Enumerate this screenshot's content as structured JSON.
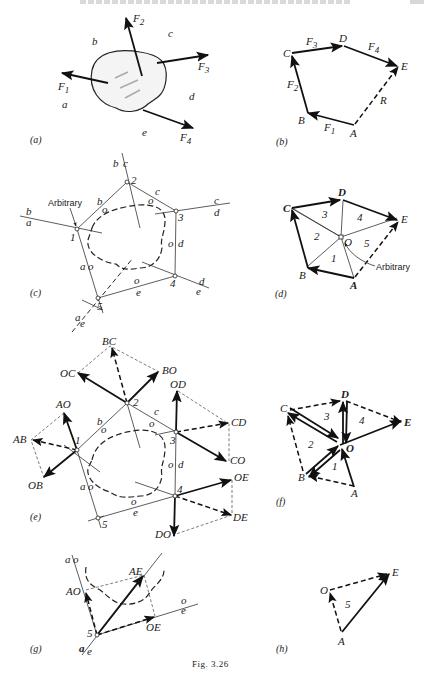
{
  "page": {
    "figure_caption": "Fig. 3.26"
  },
  "panels": {
    "a": {
      "caption": "(a)",
      "forces": [
        "F1",
        "F2",
        "F3",
        "F4"
      ],
      "force_labels": {
        "F1": "F",
        "F2": "F",
        "F3": "F",
        "F4": "F"
      },
      "force_subs": {
        "F1": "1",
        "F2": "2",
        "F3": "3",
        "F4": "4"
      },
      "spaces": [
        "a",
        "b",
        "c",
        "d",
        "e"
      ]
    },
    "b": {
      "caption": "(b)",
      "points": [
        "A",
        "B",
        "C",
        "D",
        "E"
      ],
      "vectors": [
        {
          "name": "F1",
          "from": "A",
          "to": "B",
          "style": "solid"
        },
        {
          "name": "F2",
          "from": "B",
          "to": "C",
          "style": "solid"
        },
        {
          "name": "F3",
          "from": "C",
          "to": "D",
          "style": "solid"
        },
        {
          "name": "F4",
          "from": "D",
          "to": "E",
          "style": "solid"
        },
        {
          "name": "R",
          "from": "A",
          "to": "E",
          "style": "dashed"
        }
      ],
      "resultant_label": "R"
    },
    "c": {
      "caption": "(c)",
      "nodes": [
        "1",
        "2",
        "3",
        "4",
        "5"
      ],
      "annotation": "Arbitrary",
      "line_labels": {
        "ba_top": "b",
        "ba_bot": "a",
        "bc_left": "b",
        "bc_right": "c",
        "cd_top": "c",
        "cd_bot": "d",
        "de_top": "d",
        "de_bot": "e",
        "ae_top": "a",
        "ae_bot": "e",
        "b": "b",
        "c": "c",
        "o": "o",
        "d": "d",
        "e": "e",
        "a": "a"
      }
    },
    "d": {
      "caption": "(d)",
      "points": [
        "A",
        "B",
        "C",
        "D",
        "E",
        "O"
      ],
      "triangles": [
        "1",
        "2",
        "3",
        "4",
        "5"
      ],
      "annotation": "Arbitrary"
    },
    "e": {
      "caption": "(e)",
      "nodes": [
        "1",
        "2",
        "3",
        "4",
        "5"
      ],
      "components": [
        "AO",
        "AB",
        "OB",
        "BC",
        "OC",
        "BO",
        "OD",
        "CD",
        "CO",
        "OE",
        "DE",
        "DO"
      ],
      "line_labels": {
        "b": "b",
        "c": "c",
        "o": "o",
        "d": "d",
        "a": "a",
        "e": "e"
      }
    },
    "f": {
      "caption": "(f)",
      "points": [
        "A",
        "B",
        "C",
        "D",
        "E",
        "O"
      ],
      "triangles": [
        "1",
        "2",
        "3",
        "4"
      ]
    },
    "g": {
      "caption": "(g)",
      "node": "5",
      "components": [
        "AO",
        "AE",
        "OE"
      ],
      "line_labels": {
        "ao_top": "a",
        "ao_right": "o",
        "oe_top": "o",
        "oe_bot": "e",
        "ae_left": "a",
        "ae_right": "e"
      }
    },
    "h": {
      "caption": "(h)",
      "points": [
        "A",
        "O",
        "E"
      ],
      "triangle": "5"
    }
  }
}
